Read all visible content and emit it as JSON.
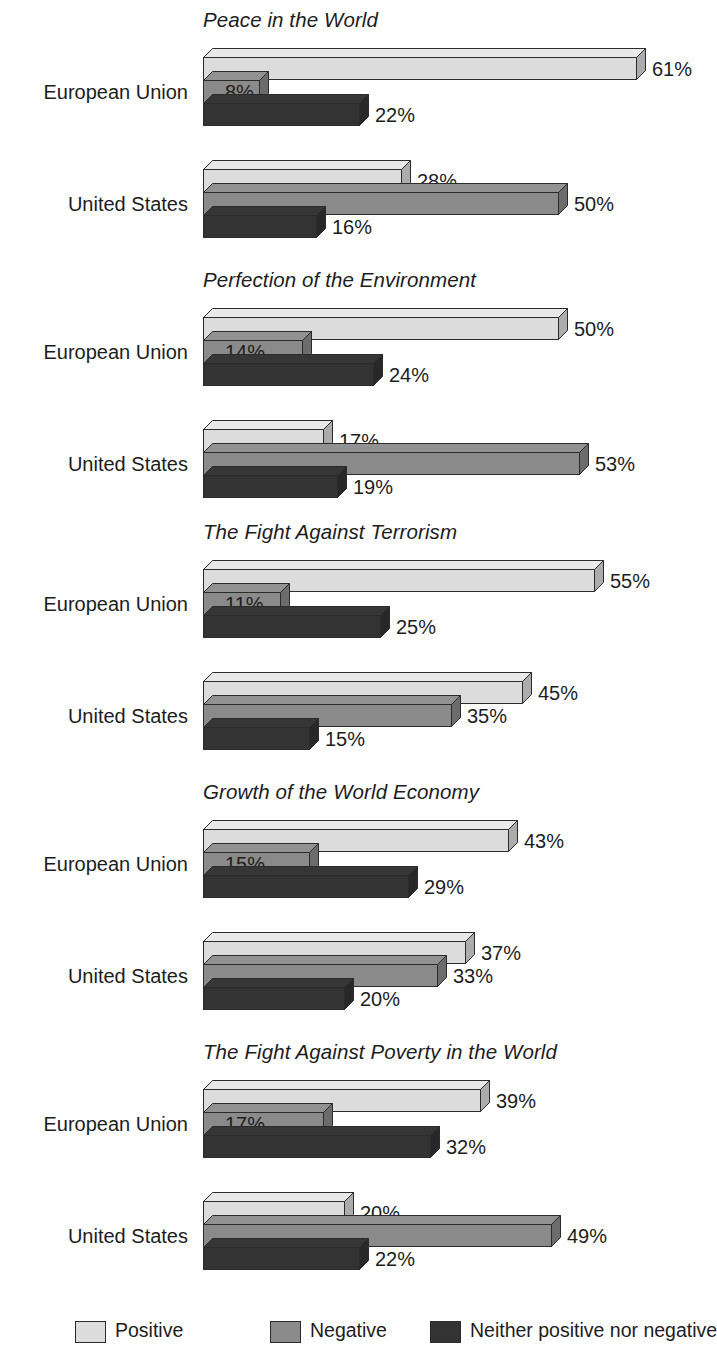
{
  "chart_data": {
    "type": "bar",
    "title": "",
    "orientation": "horizontal",
    "style": "3d-stacked-group",
    "xlabel": "",
    "ylabel": "",
    "xlim": [
      0,
      65
    ],
    "grid": false,
    "legend_position": "bottom",
    "value_suffix": "%",
    "categories": [
      "European Union",
      "United States"
    ],
    "series": [
      {
        "name": "Positive",
        "color": "#dcdcdc"
      },
      {
        "name": "Negative",
        "color": "#8a8a8a"
      },
      {
        "name": "Neither positive nor negative",
        "color": "#333333"
      }
    ],
    "panels": [
      {
        "title": "Peace in the World",
        "rows": [
          {
            "category": "European Union",
            "values": [
              61,
              8,
              22
            ],
            "labels": [
              "61%",
              "8%",
              "22%"
            ]
          },
          {
            "category": "United States",
            "values": [
              28,
              50,
              16
            ],
            "labels": [
              "28%",
              "50%",
              "16%"
            ]
          }
        ]
      },
      {
        "title": "Perfection of the Environment",
        "rows": [
          {
            "category": "European Union",
            "values": [
              50,
              14,
              24
            ],
            "labels": [
              "50%",
              "14%",
              "24%"
            ]
          },
          {
            "category": "United States",
            "values": [
              17,
              53,
              19
            ],
            "labels": [
              "17%",
              "53%",
              "19%"
            ]
          }
        ]
      },
      {
        "title": "The Fight Against Terrorism",
        "rows": [
          {
            "category": "European Union",
            "values": [
              55,
              11,
              25
            ],
            "labels": [
              "55%",
              "11%",
              "25%"
            ]
          },
          {
            "category": "United States",
            "values": [
              45,
              35,
              15
            ],
            "labels": [
              "45%",
              "35%",
              "15%"
            ]
          }
        ]
      },
      {
        "title": "Growth of the World Economy",
        "rows": [
          {
            "category": "European Union",
            "values": [
              43,
              15,
              29
            ],
            "labels": [
              "43%",
              "15%",
              "29%"
            ]
          },
          {
            "category": "United States",
            "values": [
              37,
              33,
              20
            ],
            "labels": [
              "37%",
              "33%",
              "20%"
            ]
          }
        ]
      },
      {
        "title": "The Fight Against Poverty in the World",
        "rows": [
          {
            "category": "European Union",
            "values": [
              39,
              17,
              32
            ],
            "labels": [
              "39%",
              "17%",
              "32%"
            ]
          },
          {
            "category": "United States",
            "values": [
              20,
              49,
              22
            ],
            "labels": [
              "20%",
              "49%",
              "22%"
            ]
          }
        ]
      }
    ]
  },
  "legend": {
    "items": [
      {
        "label": "Positive",
        "color": "#dcdcdc"
      },
      {
        "label": "Negative",
        "color": "#8a8a8a"
      },
      {
        "label": "Neither positive nor negative",
        "color": "#333333"
      }
    ]
  },
  "layout": {
    "bar_origin_x": 203,
    "px_per_percent": 7.12,
    "bar_height": 23,
    "depth": 9,
    "panel_tops": [
      8,
      268,
      520,
      780,
      1040
    ],
    "row_offsets": [
      40,
      152
    ],
    "label_col_width": 188,
    "legend_x": [
      75,
      270,
      430
    ]
  }
}
